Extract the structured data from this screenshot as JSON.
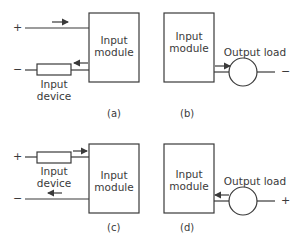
{
  "diagram": {
    "panels": [
      {
        "id": "a",
        "caption": "(a)",
        "module_label_1": "Input",
        "module_label_2": "module",
        "device_label_1": "Input",
        "device_label_2": "device",
        "plus": "+",
        "minus": "−"
      },
      {
        "id": "b",
        "caption": "(b)",
        "module_label_1": "Input",
        "module_label_2": "module",
        "load_label": "Output load",
        "terminal": "−"
      },
      {
        "id": "c",
        "caption": "(c)",
        "module_label_1": "Input",
        "module_label_2": "module",
        "device_label_1": "Input",
        "device_label_2": "device",
        "plus": "+",
        "minus": "−"
      },
      {
        "id": "d",
        "caption": "(d)",
        "module_label_1": "Input",
        "module_label_2": "module",
        "load_label": "Output load",
        "terminal": "+"
      }
    ],
    "colors": {
      "line": "#3a3a3a",
      "background": "#ffffff"
    }
  }
}
